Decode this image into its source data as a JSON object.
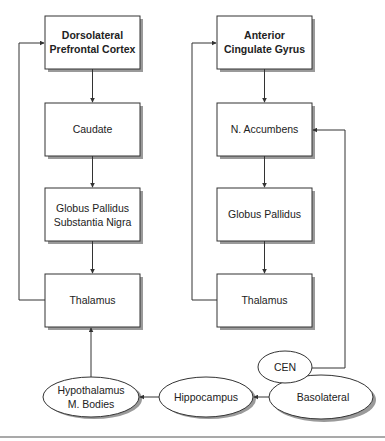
{
  "diagram": {
    "colors": {
      "line": "#333333",
      "shadow": "#9a9a9a",
      "fill": "#ffffff",
      "text": "#222222"
    },
    "left_circuit": {
      "nodes": [
        {
          "id": "dlpfc",
          "lines": [
            "Dorsolateral",
            "Prefrontal Cortex"
          ],
          "bold": true
        },
        {
          "id": "caudate",
          "lines": [
            "Caudate"
          ]
        },
        {
          "id": "gp_sn",
          "lines": [
            "Globus Pallidus",
            "Substantia Nigra"
          ]
        },
        {
          "id": "thalamus_left",
          "lines": [
            "Thalamus"
          ]
        }
      ]
    },
    "right_circuit": {
      "nodes": [
        {
          "id": "acg",
          "lines": [
            "Anterior",
            "Cingulate Gyrus"
          ],
          "bold": true
        },
        {
          "id": "n_accumbens",
          "lines": [
            "N. Accumbens"
          ]
        },
        {
          "id": "gp_right",
          "lines": [
            "Globus Pallidus"
          ]
        },
        {
          "id": "thalamus_right",
          "lines": [
            "Thalamus"
          ]
        }
      ]
    },
    "limbic_nodes": [
      {
        "id": "hypothalamus",
        "lines": [
          "Hypothalamus",
          "M. Bodies"
        ]
      },
      {
        "id": "hippocampus",
        "lines": [
          "Hippocampus"
        ]
      },
      {
        "id": "basolateral",
        "lines": [
          "Basolateral"
        ]
      },
      {
        "id": "cen",
        "lines": [
          "CEN"
        ]
      }
    ],
    "edges": [
      {
        "from": "dlpfc",
        "to": "caudate"
      },
      {
        "from": "caudate",
        "to": "gp_sn"
      },
      {
        "from": "gp_sn",
        "to": "thalamus_left"
      },
      {
        "from": "thalamus_left",
        "to": "dlpfc"
      },
      {
        "from": "acg",
        "to": "n_accumbens"
      },
      {
        "from": "n_accumbens",
        "to": "gp_right"
      },
      {
        "from": "gp_right",
        "to": "thalamus_right"
      },
      {
        "from": "thalamus_right",
        "to": "acg"
      },
      {
        "from": "cen",
        "to": "n_accumbens"
      },
      {
        "from": "basolateral",
        "to": "hippocampus"
      },
      {
        "from": "hippocampus",
        "to": "hypothalamus"
      },
      {
        "from": "hypothalamus",
        "to": "thalamus_left"
      }
    ]
  }
}
